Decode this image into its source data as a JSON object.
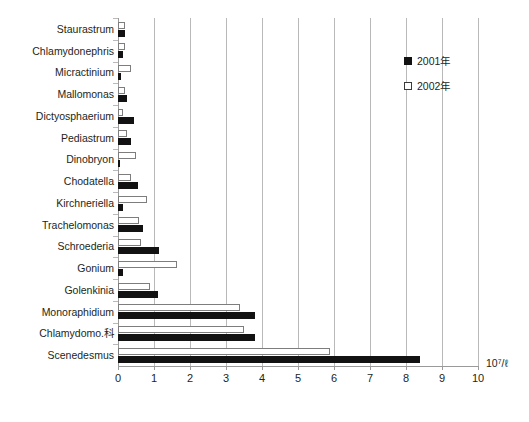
{
  "chart_data": {
    "type": "bar",
    "orientation": "horizontal",
    "title": "",
    "xlabel": "10⁷/ℓ",
    "ylabel": "",
    "xlim": [
      0,
      10
    ],
    "xticks": [
      0,
      1,
      2,
      3,
      4,
      5,
      6,
      7,
      8,
      9,
      10
    ],
    "xtick_labels": [
      "0",
      "1",
      "2",
      "3",
      "4",
      "5",
      "6",
      "7",
      "8",
      "9",
      "10"
    ],
    "grid": true,
    "legend_position": "top-right",
    "categories": [
      "Staurastrum",
      "Chlamydonephris",
      "Micractinium",
      "Mallomonas",
      "Dictyosphaerium",
      "Pediastrum",
      "Dinobryon",
      "Chodatella",
      "Kirchneriella",
      "Trachelomonas",
      "Schroederia",
      "Gonium",
      "Golenkinia",
      "Monoraphidium",
      "Chlamydomo.科",
      "Scenedesmus"
    ],
    "series": [
      {
        "name": "2002年",
        "style": "open",
        "color": "#ffffff",
        "edge_color": "#7d7d7d",
        "values": [
          0.2,
          0.2,
          0.35,
          0.2,
          0.13,
          0.25,
          0.5,
          0.35,
          0.8,
          0.58,
          0.65,
          1.65,
          0.9,
          3.4,
          3.5,
          5.9
        ]
      },
      {
        "name": "2001年",
        "style": "filled",
        "color": "#121212",
        "edge_color": "#121212",
        "values": [
          0.2,
          0.15,
          0.07,
          0.25,
          0.45,
          0.35,
          0.02,
          0.55,
          0.15,
          0.7,
          1.15,
          0.15,
          1.1,
          3.8,
          3.8,
          8.4
        ]
      }
    ]
  },
  "caption": ""
}
